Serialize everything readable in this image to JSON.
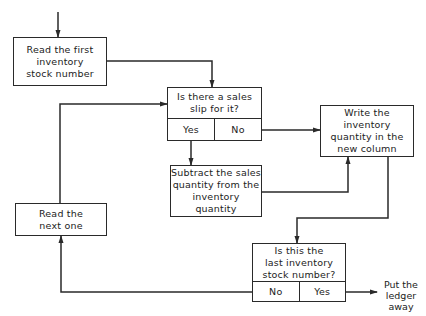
{
  "flowchart": {
    "nodes": {
      "start": {
        "text": "Read the first\ninventory\nstock number"
      },
      "decision_slip": {
        "question": "Is there a sales\nslip for it?",
        "option_left": "Yes",
        "option_right": "No"
      },
      "subtract": {
        "text": "Subtract the sales\nquantity from the\ninventory quantity"
      },
      "write": {
        "text": "Write the\ninventory\nquantity in the\nnew column"
      },
      "next": {
        "text": "Read the\nnext one"
      },
      "decision_last": {
        "question": "Is this the\nlast inventory\nstock number?",
        "option_left": "No",
        "option_right": "Yes"
      },
      "end": {
        "text": "Put the\nledger\naway"
      }
    },
    "edges": [
      {
        "from": "entry",
        "to": "start"
      },
      {
        "from": "start",
        "to": "decision_slip"
      },
      {
        "from": "decision_slip",
        "label": "Yes",
        "to": "subtract"
      },
      {
        "from": "decision_slip",
        "label": "No",
        "to": "write"
      },
      {
        "from": "subtract",
        "to": "write"
      },
      {
        "from": "write",
        "to": "decision_last"
      },
      {
        "from": "decision_last",
        "label": "No",
        "to": "next"
      },
      {
        "from": "decision_last",
        "label": "Yes",
        "to": "end"
      },
      {
        "from": "next",
        "to": "decision_slip"
      }
    ],
    "colors": {
      "line": "#2a2a2a",
      "background": "#ffffff"
    }
  }
}
